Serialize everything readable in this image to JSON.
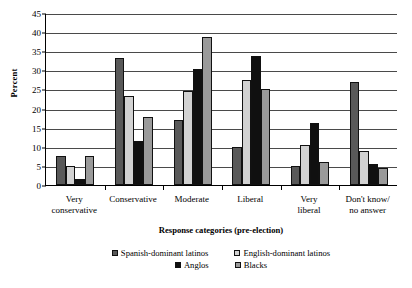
{
  "chart_data": {
    "type": "bar",
    "title": "",
    "xlabel": "Response categories (pre-election)",
    "ylabel": "Percent",
    "ylim": [
      0,
      45
    ],
    "ytick_step": 5,
    "yticks": [
      0,
      5,
      10,
      15,
      20,
      25,
      30,
      35,
      40,
      45
    ],
    "grid": true,
    "legend_position": "bottom",
    "categories": [
      "Very conservative",
      "Conservative",
      "Moderate",
      "Liberal",
      "Very liberal",
      "Don't know/ no answer"
    ],
    "category_lines": [
      [
        "Very",
        "conservative"
      ],
      [
        "Conservative"
      ],
      [
        "Moderate"
      ],
      [
        "Liberal"
      ],
      [
        "Very",
        "liberal"
      ],
      [
        "Don't know/",
        "no answer"
      ]
    ],
    "series": [
      {
        "name": "Spanish-dominant latinos",
        "color": "#595959",
        "values": [
          7.5,
          33.3,
          17.0,
          10.0,
          5.0,
          27.0
        ]
      },
      {
        "name": "English-dominant latinos",
        "color": "#d2d2d2",
        "values": [
          5.0,
          23.2,
          24.5,
          27.5,
          10.5,
          8.8
        ]
      },
      {
        "name": "Anglos",
        "color": "#101010",
        "values": [
          1.7,
          11.5,
          30.3,
          33.8,
          16.2,
          5.5
        ]
      },
      {
        "name": "Blacks",
        "color": "#9a9a9a",
        "values": [
          7.5,
          17.7,
          38.8,
          25.0,
          6.0,
          4.5
        ]
      }
    ]
  }
}
